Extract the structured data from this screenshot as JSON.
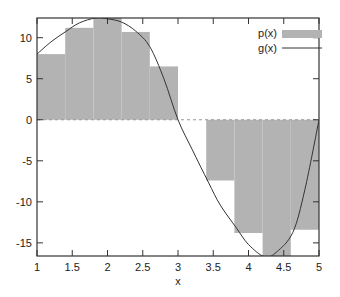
{
  "chart_data": {
    "type": "bar",
    "title": "",
    "xlabel": "x",
    "ylabel": "",
    "xlim": [
      1,
      5
    ],
    "ylim": [
      -16.6,
      12.4
    ],
    "grid": false,
    "legend_position": "top-right",
    "xticks": [
      1,
      1.5,
      2,
      2.5,
      3,
      3.5,
      4,
      4.5,
      5
    ],
    "xtick_labels": [
      "1",
      "1.5",
      "2",
      "2.5",
      "3",
      "3.5",
      "4",
      "4.5",
      "5"
    ],
    "yticks": [
      -15,
      -10,
      -5,
      0,
      5,
      10
    ],
    "ytick_labels": [
      "-15",
      "-10",
      "-5",
      "0",
      "5",
      "10"
    ],
    "zero_line": {
      "y": 0,
      "style": "dashed"
    },
    "series": [
      {
        "name": "p(x)",
        "type": "bar",
        "color": "#b3b3b3",
        "bin_edges": [
          1.0,
          1.4,
          1.8,
          2.2,
          2.6,
          3.0,
          3.4,
          3.8,
          4.2,
          4.6,
          5.0
        ],
        "values": [
          8.0,
          11.2,
          12.4,
          10.7,
          6.5,
          0.0,
          -7.4,
          -13.8,
          -16.6,
          -13.4
        ]
      },
      {
        "name": "g(x)",
        "type": "line",
        "color": "#333333",
        "x": [
          1.0,
          1.2,
          1.4,
          1.6,
          1.83,
          2.0,
          2.2,
          2.4,
          2.6,
          2.8,
          3.0,
          3.2,
          3.43,
          3.6,
          3.83,
          4.0,
          4.23,
          4.4,
          4.63,
          4.8,
          5.0
        ],
        "y": [
          8.0,
          9.5,
          10.7,
          11.8,
          12.4,
          12.3,
          11.9,
          10.8,
          8.9,
          5.0,
          0.0,
          -3.6,
          -7.6,
          -10.4,
          -13.2,
          -15.2,
          -16.7,
          -16.1,
          -13.7,
          -8.5,
          0.0
        ]
      }
    ]
  },
  "legend": {
    "items": [
      {
        "label": "p(x)",
        "kind": "bar",
        "color": "#b3b3b3"
      },
      {
        "label": "g(x)",
        "kind": "line",
        "color": "#333333"
      }
    ]
  },
  "axes": {
    "xlabel": "x"
  },
  "colors": {
    "bar_fill": "#b3b3b3",
    "line": "#333333",
    "axis": "#333333",
    "zero_line": "#888888"
  }
}
